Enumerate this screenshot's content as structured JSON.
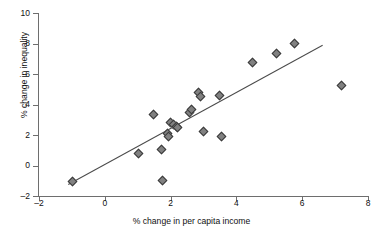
{
  "chart_data": {
    "type": "scatter",
    "title": "",
    "xlabel": "% change in per capita income",
    "ylabel": "% change in inequality",
    "xlim": [
      -2,
      8
    ],
    "ylim": [
      -2,
      10
    ],
    "xticks": [
      -2,
      0,
      2,
      4,
      6,
      8
    ],
    "yticks": [
      -2,
      0,
      2,
      4,
      6,
      8,
      10
    ],
    "xtick_labels": [
      "-2",
      "0",
      "2",
      "4",
      "6",
      "8"
    ],
    "ytick_labels": [
      "-2",
      "0",
      "2",
      "4",
      "6",
      "8",
      "10"
    ],
    "grid": false,
    "legend": "none",
    "marker": "diamond",
    "marker_color": "#818181",
    "marker_edge_color": "#3a3a3a",
    "points": [
      {
        "x": -0.97,
        "y": -1.05
      },
      {
        "x": 1.02,
        "y": 0.78
      },
      {
        "x": 1.47,
        "y": 3.32
      },
      {
        "x": 1.72,
        "y": 1.02
      },
      {
        "x": 1.76,
        "y": -0.98
      },
      {
        "x": 1.9,
        "y": 2.08
      },
      {
        "x": 1.93,
        "y": 1.92
      },
      {
        "x": 2.0,
        "y": 2.82
      },
      {
        "x": 2.1,
        "y": 2.7
      },
      {
        "x": 2.17,
        "y": 2.56
      },
      {
        "x": 2.2,
        "y": 2.48
      },
      {
        "x": 2.58,
        "y": 3.46
      },
      {
        "x": 2.64,
        "y": 3.7
      },
      {
        "x": 2.86,
        "y": 4.78
      },
      {
        "x": 2.9,
        "y": 4.52
      },
      {
        "x": 3.01,
        "y": 2.21
      },
      {
        "x": 3.48,
        "y": 4.62
      },
      {
        "x": 3.55,
        "y": 1.9
      },
      {
        "x": 4.5,
        "y": 6.74
      },
      {
        "x": 5.21,
        "y": 7.34
      },
      {
        "x": 5.78,
        "y": 7.98
      },
      {
        "x": 7.19,
        "y": 5.24
      }
    ],
    "trendline": {
      "type": "linear",
      "x_start": -1.12,
      "y_start": -1.22,
      "x_end": 6.62,
      "y_end": 7.92,
      "color": "#4a4a4a"
    }
  }
}
